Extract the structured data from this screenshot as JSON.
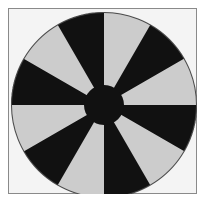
{
  "figure": {
    "title": "",
    "caption": "",
    "width": 208,
    "height": 213,
    "background_color": "#ffffff"
  },
  "frame": {
    "name": "plot-frame",
    "x": 8,
    "y": 8,
    "width": 189,
    "height": 186,
    "fill_color": "#f4f4f4",
    "border_color": "#8a8a8a",
    "border_width": 1
  },
  "diagram": {
    "name": "radial-spoke-wheel",
    "type": "radial-sector-pattern",
    "center_x": 104,
    "center_y": 105,
    "outer_radius": 93,
    "hub_radius": 20,
    "sector_count": 12,
    "sector_angle_deg": 30,
    "start_angle_deg": -90,
    "dark_color": "#111111",
    "light_color": "#cccccc",
    "hub_color": "#111111",
    "outline_color": "#4a4a4a",
    "outline_width": 1,
    "sectors": [
      {
        "index": 0,
        "start_deg": -90,
        "end_deg": -60,
        "color": "#cccccc",
        "tone": "light"
      },
      {
        "index": 1,
        "start_deg": -60,
        "end_deg": -30,
        "color": "#111111",
        "tone": "dark"
      },
      {
        "index": 2,
        "start_deg": -30,
        "end_deg": 0,
        "color": "#cccccc",
        "tone": "light"
      },
      {
        "index": 3,
        "start_deg": 0,
        "end_deg": 30,
        "color": "#111111",
        "tone": "dark"
      },
      {
        "index": 4,
        "start_deg": 30,
        "end_deg": 60,
        "color": "#cccccc",
        "tone": "light"
      },
      {
        "index": 5,
        "start_deg": 60,
        "end_deg": 90,
        "color": "#111111",
        "tone": "dark"
      },
      {
        "index": 6,
        "start_deg": 90,
        "end_deg": 120,
        "color": "#cccccc",
        "tone": "light"
      },
      {
        "index": 7,
        "start_deg": 120,
        "end_deg": 150,
        "color": "#111111",
        "tone": "dark"
      },
      {
        "index": 8,
        "start_deg": 150,
        "end_deg": 180,
        "color": "#cccccc",
        "tone": "light"
      },
      {
        "index": 9,
        "start_deg": 180,
        "end_deg": 210,
        "color": "#111111",
        "tone": "dark"
      },
      {
        "index": 10,
        "start_deg": 210,
        "end_deg": 240,
        "color": "#cccccc",
        "tone": "light"
      },
      {
        "index": 11,
        "start_deg": 240,
        "end_deg": 270,
        "color": "#111111",
        "tone": "dark"
      }
    ]
  }
}
